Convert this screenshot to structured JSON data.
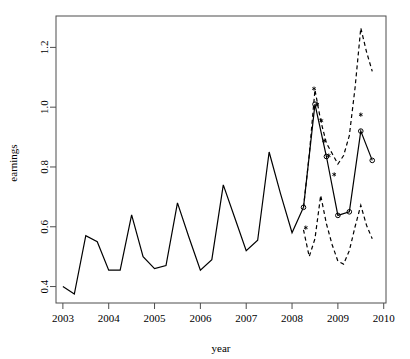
{
  "chart_data": {
    "type": "line",
    "title": "",
    "xlabel": "year",
    "ylabel": "earnings",
    "xlim": [
      2002.85,
      2010.05
    ],
    "ylim": [
      0.345,
      1.305
    ],
    "grid": false,
    "legend": false,
    "xticks": [
      2003,
      2004,
      2005,
      2006,
      2007,
      2008,
      2009,
      2010
    ],
    "xtick_labels": [
      "2003",
      "2004",
      "2005",
      "2006",
      "2007",
      "2008",
      "2009",
      "2010"
    ],
    "yticks": [
      0.4,
      0.6,
      0.8,
      1.0,
      1.2
    ],
    "ytick_labels": [
      "0.4",
      "0.6",
      "0.8",
      "1.0",
      "1.2"
    ],
    "series": [
      {
        "name": "observed",
        "style": "solid",
        "color": "#000000",
        "linewidth": 1.2,
        "marker": "none",
        "x": [
          2003.0,
          2003.25,
          2003.5,
          2003.75,
          2004.0,
          2004.25,
          2004.5,
          2004.75,
          2005.0,
          2005.25,
          2005.5,
          2005.75,
          2006.0,
          2006.25,
          2006.5,
          2006.75,
          2007.0,
          2007.25,
          2007.5,
          2007.75,
          2008.0,
          2008.25
        ],
        "values": [
          0.4,
          0.375,
          0.57,
          0.55,
          0.455,
          0.455,
          0.64,
          0.5,
          0.46,
          0.47,
          0.68,
          0.565,
          0.455,
          0.49,
          0.74,
          0.63,
          0.52,
          0.555,
          0.85,
          0.71,
          0.58,
          0.665
        ]
      },
      {
        "name": "forecast",
        "style": "solid",
        "color": "#000000",
        "linewidth": 1.2,
        "marker": "circle",
        "x": [
          2008.25,
          2008.5,
          2008.75,
          2009.0,
          2009.25,
          2009.5,
          2009.75
        ],
        "values": [
          0.665,
          1.01,
          0.835,
          0.638,
          0.65,
          0.92,
          0.822
        ]
      },
      {
        "name": "upper-prediction-interval",
        "style": "dashed",
        "color": "#000000",
        "linewidth": 1.2,
        "marker": "none",
        "x": [
          2008.25,
          2008.375,
          2008.5,
          2008.625,
          2008.75,
          2008.875,
          2009.0,
          2009.125,
          2009.25,
          2009.375,
          2009.5,
          2009.625,
          2009.75
        ],
        "values": [
          0.665,
          0.84,
          1.058,
          0.955,
          0.88,
          0.845,
          0.81,
          0.838,
          0.905,
          1.065,
          1.265,
          1.185,
          1.12
        ]
      },
      {
        "name": "lower-prediction-interval",
        "style": "dashed",
        "color": "#000000",
        "linewidth": 1.2,
        "marker": "none",
        "x": [
          2008.25,
          2008.375,
          2008.5,
          2008.625,
          2008.75,
          2008.875,
          2009.0,
          2009.125,
          2009.25,
          2009.375,
          2009.5,
          2009.625,
          2009.75
        ],
        "values": [
          0.59,
          0.5,
          0.56,
          0.705,
          0.61,
          0.54,
          0.485,
          0.475,
          0.52,
          0.6,
          0.672,
          0.605,
          0.56
        ]
      }
    ],
    "point_markers": [
      {
        "name": "asterisk-points",
        "symbol": "*",
        "color": "#000000",
        "x": [
          2008.3,
          2008.48,
          2008.55,
          2008.64,
          2008.7,
          2008.8,
          2008.92,
          2009.5
        ],
        "values": [
          0.597,
          1.062,
          1.01,
          0.955,
          0.888,
          0.838,
          0.775,
          0.975
        ]
      }
    ],
    "markers_note": "open circles on forecast line; asterisks mark individual realizations"
  },
  "axes": {
    "xlabel": "year",
    "ylabel": "earnings",
    "frame_color": "#4d4d4d",
    "tick_color": "#4d4d4d",
    "background": "#ffffff"
  }
}
